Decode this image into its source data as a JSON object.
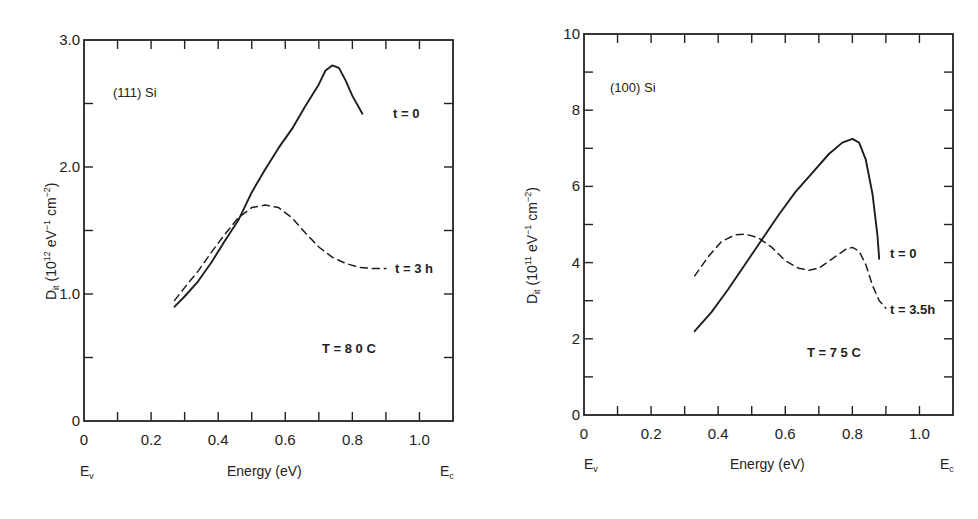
{
  "chart_data": [
    {
      "type": "line",
      "title": "",
      "annotation": "(111) Si",
      "temperature_label": "T = 8 0 C",
      "xlabel": "Energy (eV)",
      "xlabel_left_end": "E_v",
      "xlabel_right_end": "E_c",
      "ylabel": "D_it (10^12 eV^-1 cm^-2)",
      "xlim": [
        0,
        1.1
      ],
      "ylim": [
        0,
        3.0
      ],
      "xticks": [
        0,
        0.2,
        0.4,
        0.6,
        0.8,
        1.0
      ],
      "xtick_labels": [
        "0",
        "0.2",
        "0.4",
        "0.6",
        "0.8",
        "1.0"
      ],
      "yticks": [
        0,
        1.0,
        2.0,
        3.0
      ],
      "ytick_labels": [
        "0",
        "1.0",
        "2.0",
        "3.0"
      ],
      "grid": false,
      "series": [
        {
          "name": "t = 0",
          "style": "solid",
          "x": [
            0.27,
            0.3,
            0.34,
            0.38,
            0.42,
            0.46,
            0.5,
            0.54,
            0.58,
            0.62,
            0.66,
            0.7,
            0.72,
            0.74,
            0.76,
            0.78,
            0.8,
            0.83
          ],
          "y": [
            0.9,
            0.98,
            1.1,
            1.25,
            1.42,
            1.58,
            1.8,
            1.98,
            2.15,
            2.3,
            2.48,
            2.65,
            2.76,
            2.8,
            2.78,
            2.68,
            2.56,
            2.42
          ]
        },
        {
          "name": "t = 3 h",
          "style": "dashed",
          "x": [
            0.27,
            0.3,
            0.34,
            0.38,
            0.42,
            0.46,
            0.5,
            0.54,
            0.58,
            0.62,
            0.66,
            0.7,
            0.74,
            0.78,
            0.82,
            0.86,
            0.9
          ],
          "y": [
            0.95,
            1.05,
            1.18,
            1.33,
            1.47,
            1.6,
            1.68,
            1.7,
            1.68,
            1.6,
            1.48,
            1.37,
            1.29,
            1.24,
            1.21,
            1.2,
            1.2
          ]
        }
      ]
    },
    {
      "type": "line",
      "title": "",
      "annotation": "(100) Si",
      "temperature_label": "T = 7 5 C",
      "xlabel": "Energy (eV)",
      "xlabel_left_end": "E_v",
      "xlabel_right_end": "E_c",
      "ylabel": "D_it (10^11 eV^-1 cm^-2)",
      "xlim": [
        0,
        1.1
      ],
      "ylim": [
        0,
        10
      ],
      "xticks": [
        0,
        0.2,
        0.4,
        0.6,
        0.8,
        1.0
      ],
      "xtick_labels": [
        "0",
        "0.2",
        "0.4",
        "0.6",
        "0.8",
        "1.0"
      ],
      "yticks": [
        0,
        2,
        4,
        6,
        8,
        10
      ],
      "ytick_labels": [
        "0",
        "2",
        "4",
        "6",
        "8",
        "10"
      ],
      "grid": false,
      "series": [
        {
          "name": "t = 0",
          "style": "solid",
          "x": [
            0.33,
            0.38,
            0.43,
            0.48,
            0.53,
            0.58,
            0.63,
            0.68,
            0.73,
            0.77,
            0.8,
            0.82,
            0.84,
            0.86,
            0.875,
            0.88
          ],
          "y": [
            2.2,
            2.7,
            3.3,
            3.95,
            4.6,
            5.25,
            5.85,
            6.35,
            6.85,
            7.15,
            7.25,
            7.15,
            6.7,
            5.8,
            4.7,
            4.1
          ]
        },
        {
          "name": "t = 3.5h",
          "style": "dashed",
          "x": [
            0.33,
            0.37,
            0.41,
            0.45,
            0.48,
            0.52,
            0.56,
            0.6,
            0.64,
            0.67,
            0.7,
            0.74,
            0.78,
            0.8,
            0.82,
            0.84,
            0.86,
            0.88,
            0.9
          ],
          "y": [
            3.65,
            4.15,
            4.55,
            4.73,
            4.75,
            4.65,
            4.4,
            4.05,
            3.85,
            3.8,
            3.85,
            4.1,
            4.35,
            4.4,
            4.3,
            3.95,
            3.4,
            3.0,
            2.8
          ]
        }
      ]
    }
  ],
  "left": {
    "sample_label": "(111) Si",
    "temp_label": "T = 8 0 C",
    "series_labels": [
      "t = 0",
      "t = 3 h"
    ],
    "ylabel_main": "D",
    "ylabel_sub": "it",
    "ylabel_rest": " (10",
    "ylabel_exp": "12",
    "ylabel_unit1": " eV",
    "ylabel_unit1_exp": "−1",
    "ylabel_unit2": " cm",
    "ylabel_unit2_exp": "−2",
    "ylabel_close": ")",
    "xlabel": "Energy (eV)",
    "ev": "E",
    "ev_sub": "v",
    "ec": "E",
    "ec_sub": "c"
  },
  "right": {
    "sample_label": "(100) Si",
    "temp_label": "T = 7 5 C",
    "series_labels": [
      "t = 0",
      "t = 3.5h"
    ],
    "ylabel_main": "D",
    "ylabel_sub": "it",
    "ylabel_rest": " (10",
    "ylabel_exp": "11",
    "ylabel_unit1": " eV",
    "ylabel_unit1_exp": "−1",
    "ylabel_unit2": " cm",
    "ylabel_unit2_exp": "−2",
    "ylabel_close": ")",
    "xlabel": "Energy (eV)",
    "ev": "E",
    "ev_sub": "v",
    "ec": "E",
    "ec_sub": "c"
  }
}
